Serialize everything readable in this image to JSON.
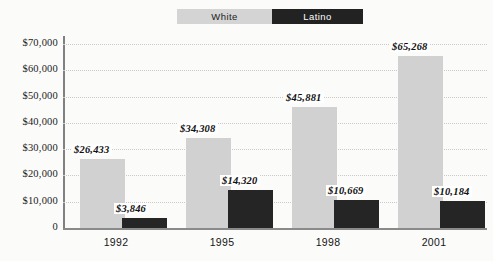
{
  "legend": {
    "items": [
      {
        "label": "White",
        "color": "#d4d4d4",
        "text_color": "#1b1b1b"
      },
      {
        "label": "Latino",
        "color": "#222222",
        "text_color": "#ffffff"
      }
    ]
  },
  "axis": {
    "y_ticks": [
      "$70,000",
      "$60,000",
      "$50,000",
      "$40,000",
      "$30,000",
      "$20,000",
      "$10,000",
      "0"
    ],
    "x_ticks": [
      "1992",
      "1995",
      "1998",
      "2001"
    ]
  },
  "chart_data": {
    "type": "bar",
    "title": "",
    "subtitle": "",
    "xlabel": "",
    "ylabel": "",
    "categories": [
      "1992",
      "1995",
      "1998",
      "2001"
    ],
    "series": [
      {
        "name": "White",
        "color": "#d1d1d1",
        "values": [
          26433,
          34308,
          45881,
          65268
        ],
        "labels": [
          "$26,433",
          "$34,308",
          "$45,881",
          "$65,268"
        ]
      },
      {
        "name": "Latino",
        "color": "#252525",
        "values": [
          3846,
          14320,
          10669,
          10184
        ],
        "labels": [
          "$3,846",
          "$14,320",
          "$10,669",
          "$10,184"
        ]
      }
    ],
    "ylim": [
      0,
      70000
    ],
    "ytick_values": [
      70000,
      60000,
      50000,
      40000,
      30000,
      20000,
      10000,
      0
    ],
    "grid": true,
    "grid_style": "dotted",
    "legend_position": "top-center"
  }
}
